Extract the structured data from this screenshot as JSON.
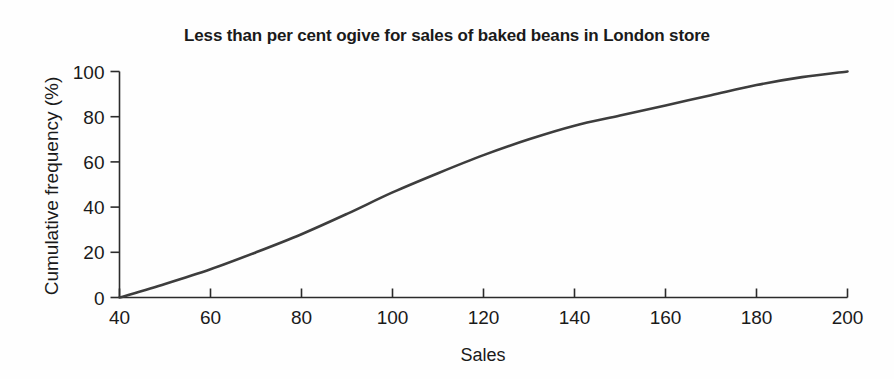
{
  "chart_data": {
    "type": "line",
    "title": "Less than per cent ogive for sales of baked beans in London store",
    "xlabel": "Sales",
    "ylabel": "Cumulative frequency (%)",
    "xlim": [
      40,
      200
    ],
    "ylim": [
      0,
      100
    ],
    "grid": false,
    "legend": false,
    "legend_position": "none",
    "x_ticks": [
      40,
      60,
      80,
      100,
      120,
      140,
      160,
      180,
      200
    ],
    "x_tick_labels": [
      "40",
      "60",
      "80",
      "100",
      "120",
      "140",
      "160",
      "180",
      "200"
    ],
    "y_ticks": [
      0,
      20,
      40,
      60,
      80,
      100
    ],
    "y_tick_labels": [
      "0",
      "20",
      "40",
      "60",
      "80",
      "100"
    ],
    "series": [
      {
        "name": "Cumulative frequency",
        "color": "#3d3d3d",
        "x": [
          40,
          50,
          60,
          70,
          80,
          90,
          100,
          110,
          120,
          130,
          140,
          150,
          160,
          170,
          180,
          190,
          200
        ],
        "values": [
          0,
          6,
          12.5,
          20,
          28,
          37,
          46.5,
          55,
          63,
          70,
          76,
          80.5,
          85,
          89.5,
          94,
          97.5,
          100
        ]
      }
    ],
    "annotations": []
  },
  "axes": {
    "title": "Less than per cent ogive for sales of baked beans in London store",
    "x_title": "Sales",
    "y_title": "Cumulative frequency (%)"
  }
}
